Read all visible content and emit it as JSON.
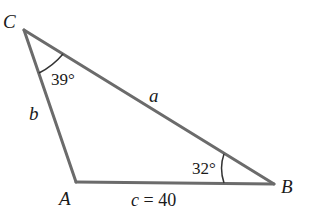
{
  "diagram": {
    "type": "triangle",
    "vertices": {
      "C": {
        "label": "C"
      },
      "A": {
        "label": "A"
      },
      "B": {
        "label": "B"
      }
    },
    "sides": {
      "a": {
        "label": "a",
        "between": "C-B"
      },
      "b": {
        "label": "b",
        "between": "C-A"
      },
      "c": {
        "label": "c = 40",
        "between": "A-B"
      }
    },
    "angles": {
      "C": {
        "label": "39°"
      },
      "B": {
        "label": "32°"
      }
    },
    "colors": {
      "line": "#6b6b6b",
      "text": "#1a1a1a"
    }
  }
}
